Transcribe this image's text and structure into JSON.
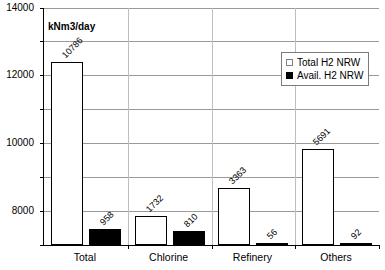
{
  "chart_data": {
    "type": "bar",
    "title": "",
    "subtitle": "",
    "units_caption": "kNm3/day",
    "xlabel": "",
    "ylabel": "",
    "ylim": [
      0,
      14000
    ],
    "ytick_step": 2000,
    "grid": true,
    "legend_position": "top-right",
    "categories": [
      "Total",
      "Chlorine",
      "Refinery",
      "Others"
    ],
    "series": [
      {
        "name": "Total H2 NRW",
        "color": "#ffffff",
        "values": [
          10786,
          1732,
          3363,
          5691
        ]
      },
      {
        "name": "Avail. H2 NRW",
        "color": "#000000",
        "values": [
          958,
          810,
          56,
          92
        ]
      }
    ],
    "yticks": [
      "0",
      "2000",
      "4000",
      "6000",
      "8000",
      "10000",
      "12000",
      "14000"
    ],
    "data_labels": [
      [
        "10786",
        "1732",
        "3363",
        "5691"
      ],
      [
        "958",
        "810",
        "56",
        "92"
      ]
    ]
  },
  "legend": {
    "items": [
      {
        "label": "Total H2 NRW",
        "swatch": "total-series"
      },
      {
        "label": "Avail. H2 NRW",
        "swatch": "avail-series"
      }
    ]
  }
}
